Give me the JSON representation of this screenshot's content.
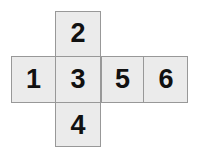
{
  "diagram": {
    "type": "cube-net",
    "shape": "cross",
    "background_color": "#ffffff",
    "face_fill_color": "#ebebeb",
    "border_color": "#989898",
    "digit_color": "#111111",
    "faces": [
      {
        "id": "face-1",
        "label": "1",
        "position": "left"
      },
      {
        "id": "face-2",
        "label": "2",
        "position": "top"
      },
      {
        "id": "face-3",
        "label": "3",
        "position": "center"
      },
      {
        "id": "face-4",
        "label": "4",
        "position": "bottom"
      },
      {
        "id": "face-5",
        "label": "5",
        "position": "right"
      },
      {
        "id": "face-6",
        "label": "6",
        "position": "far-right"
      }
    ]
  }
}
